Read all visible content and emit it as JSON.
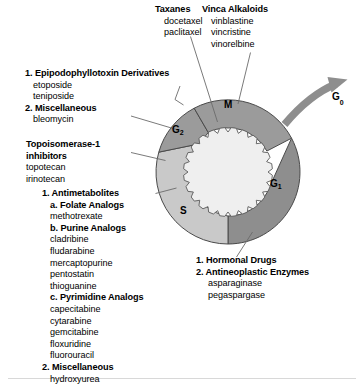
{
  "figure": {
    "colors": {
      "phase_m": "#9b9b9b",
      "phase_g1": "#8e8e8e",
      "phase_s": "#c9c9c9",
      "phase_g2": "#9b9b9b",
      "nucleus": "#efefef",
      "arrow": "#8e8e8e",
      "outline": "#4a4a4a",
      "leader": "#6b6b6b",
      "text": "#000000",
      "background": "#ffffff",
      "footer_rule": "#d8d8d8"
    }
  },
  "wheel": {
    "label_m": "M",
    "label_g1": "G",
    "label_g1_sub": "1",
    "label_s": "S",
    "label_g2": "G",
    "label_g2_sub": "2",
    "label_g0": "G",
    "label_g0_sub": "0"
  },
  "callouts": {
    "taxanes": {
      "heading": "Taxanes",
      "drugs": [
        "docetaxel",
        "paclitaxel"
      ]
    },
    "vinca_alkaloids": {
      "heading": "Vinca Alkaloids",
      "drugs": [
        "vinblastine",
        "vincristine",
        "vinorelbine"
      ]
    },
    "g2_group": {
      "item1_heading": "1. Epipodophyllotoxin Derivatives",
      "item1_drugs": [
        "etoposide",
        "teniposide"
      ],
      "item2_heading": "2. Miscellaneous",
      "item2_drugs": [
        "bleomycin"
      ]
    },
    "topoisomerase": {
      "heading_line1": "Topoisomerase-1",
      "heading_line2": "inhibitors",
      "drugs": [
        "topotecan",
        "irinotecan"
      ]
    },
    "s_phase": {
      "item1_heading": "1. Antimetabolites",
      "sub_a_heading": "a. Folate Analogs",
      "sub_a_drugs": [
        "methotrexate"
      ],
      "sub_b_heading": "b. Purine Analogs",
      "sub_b_drugs": [
        "cladribine",
        "fludarabine",
        "mercaptopurine",
        "pentostatin",
        "thioguanine"
      ],
      "sub_c_heading": "c. Pyrimidine Analogs",
      "sub_c_drugs": [
        "capecitabine",
        "cytarabine",
        "gemcitabine",
        "floxuridine",
        "fluorouracil"
      ],
      "item2_heading": "2. Miscellaneous",
      "item2_drugs": [
        "hydroxyurea"
      ]
    },
    "g1_phase": {
      "item1_heading": "1. Hormonal Drugs",
      "item2_heading": "2. Antineoplastic Enzymes",
      "item2_drugs": [
        "asparaginase",
        "pegaspargase"
      ]
    }
  }
}
